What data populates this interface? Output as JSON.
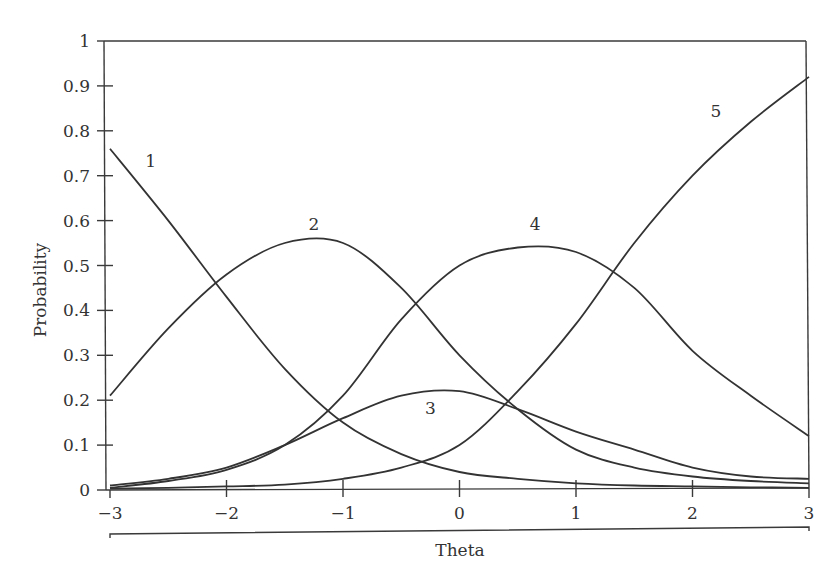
{
  "chart_data": {
    "type": "line",
    "title": "",
    "xlabel": "Theta",
    "ylabel": "Probability",
    "xlim": [
      -3,
      3
    ],
    "ylim": [
      0,
      1
    ],
    "grid": false,
    "legend": "none (curves labeled inline with numbers 1-5)",
    "x_ticks": [
      "-3",
      "-2",
      "-1",
      "0",
      "1",
      "2",
      "3"
    ],
    "y_ticks": [
      "0",
      "0.1",
      "0.2",
      "0.3",
      "0.4",
      "0.5",
      "0.6",
      "0.7",
      "0.8",
      "0.9",
      "1"
    ],
    "x": [
      -3,
      -2.5,
      -2,
      -1.5,
      -1,
      -0.5,
      0,
      0.5,
      1,
      1.5,
      2,
      2.5,
      3
    ],
    "series": [
      {
        "name": "1",
        "values": [
          0.76,
          0.6,
          0.43,
          0.27,
          0.15,
          0.08,
          0.04,
          0.025,
          0.015,
          0.01,
          0.008,
          0.006,
          0.005
        ],
        "label_pos": [
          -2.65,
          0.72
        ]
      },
      {
        "name": "2",
        "values": [
          0.21,
          0.36,
          0.48,
          0.55,
          0.55,
          0.45,
          0.3,
          0.18,
          0.09,
          0.05,
          0.03,
          0.02,
          0.015
        ],
        "label_pos": [
          -1.25,
          0.58
        ]
      },
      {
        "name": "3",
        "values": [
          0.01,
          0.025,
          0.05,
          0.1,
          0.16,
          0.21,
          0.22,
          0.18,
          0.13,
          0.09,
          0.05,
          0.03,
          0.025
        ],
        "label_pos": [
          -0.25,
          0.17
        ]
      },
      {
        "name": "4",
        "values": [
          0.005,
          0.02,
          0.045,
          0.1,
          0.21,
          0.38,
          0.5,
          0.54,
          0.53,
          0.45,
          0.31,
          0.21,
          0.12
        ],
        "label_pos": [
          0.65,
          0.58
        ]
      },
      {
        "name": "5",
        "values": [
          0.003,
          0.005,
          0.008,
          0.012,
          0.025,
          0.05,
          0.1,
          0.22,
          0.37,
          0.55,
          0.7,
          0.82,
          0.92
        ],
        "label_pos": [
          2.2,
          0.83
        ]
      }
    ]
  }
}
